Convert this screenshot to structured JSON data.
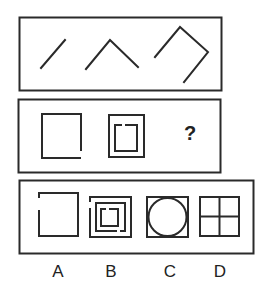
{
  "puzzle": {
    "row1": {
      "figures": [
        "one-stroke",
        "two-strokes",
        "four-strokes"
      ]
    },
    "row2": {
      "figures": [
        "square-open-corner",
        "nested-squares-open"
      ],
      "question_mark": "?"
    },
    "options": [
      {
        "label": "A",
        "figure": "square-with-gap-left"
      },
      {
        "label": "B",
        "figure": "three-nested-squares-with-gaps"
      },
      {
        "label": "C",
        "figure": "circle-inscribed-in-square"
      },
      {
        "label": "D",
        "figure": "square-divided-into-four"
      }
    ]
  },
  "colors": {
    "stroke": "#2a2a2a",
    "background": "#ffffff"
  }
}
